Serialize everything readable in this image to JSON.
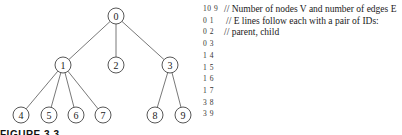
{
  "tree": {
    "nodes": [
      {
        "id": "0",
        "x": 116,
        "y": 16
      },
      {
        "id": "1",
        "x": 63,
        "y": 65
      },
      {
        "id": "2",
        "x": 116,
        "y": 65
      },
      {
        "id": "3",
        "x": 170,
        "y": 65
      },
      {
        "id": "4",
        "x": 21,
        "y": 115
      },
      {
        "id": "5",
        "x": 49,
        "y": 115
      },
      {
        "id": "6",
        "x": 76,
        "y": 115
      },
      {
        "id": "7",
        "x": 103,
        "y": 115
      },
      {
        "id": "8",
        "x": 155,
        "y": 115
      },
      {
        "id": "9",
        "x": 183,
        "y": 115
      }
    ],
    "edges": [
      [
        "0",
        "1"
      ],
      [
        "0",
        "2"
      ],
      [
        "0",
        "3"
      ],
      [
        "1",
        "4"
      ],
      [
        "1",
        "5"
      ],
      [
        "1",
        "6"
      ],
      [
        "1",
        "7"
      ],
      [
        "3",
        "8"
      ],
      [
        "3",
        "9"
      ]
    ]
  },
  "listing": {
    "rows": [
      {
        "pair": "10 9",
        "comment": "// Number of nodes V and number of edges E",
        "comment_x": 21
      },
      {
        "pair": "0 1",
        "comment": "// E lines follow each with a pair of IDs:",
        "comment_x": 23
      },
      {
        "pair": "0 2",
        "comment": "// parent, child",
        "comment_x": 21
      },
      {
        "pair": "0 3",
        "comment": ""
      },
      {
        "pair": "1 4",
        "comment": ""
      },
      {
        "pair": "1 5",
        "comment": ""
      },
      {
        "pair": "1 6",
        "comment": ""
      },
      {
        "pair": "1 7",
        "comment": ""
      },
      {
        "pair": "3 8",
        "comment": ""
      },
      {
        "pair": "3 9",
        "comment": ""
      }
    ]
  },
  "caption": "FIGURE 3.3"
}
